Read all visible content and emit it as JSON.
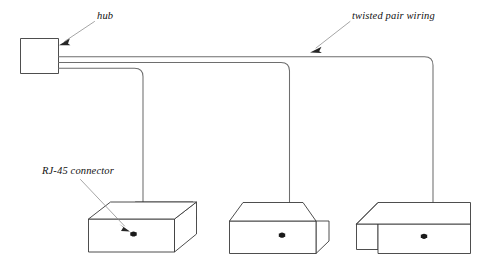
{
  "diagram": {
    "background_color": "#ffffff",
    "line_color": "#3a3a3a",
    "cable_color": "#6e6e6e",
    "leader_color": "#888888",
    "labels": {
      "hub": "hub",
      "twisted_pair": "twisted pair wiring",
      "rj45": "RJ-45 connector"
    },
    "nodes": {
      "hub": {
        "name": "hub",
        "shape": "rectangle",
        "ports": 3
      },
      "workstations": [
        {
          "name": "workstation-1",
          "shape": "isometric-box"
        },
        {
          "name": "workstation-2",
          "shape": "isometric-box"
        },
        {
          "name": "workstation-3",
          "shape": "isometric-box"
        }
      ]
    },
    "cables": [
      {
        "name": "cable-1",
        "from": "hub",
        "to": "workstation-1",
        "type": "twisted pair"
      },
      {
        "name": "cable-2",
        "from": "hub",
        "to": "workstation-2",
        "type": "twisted pair"
      },
      {
        "name": "cable-3",
        "from": "hub",
        "to": "workstation-3",
        "type": "twisted pair"
      }
    ],
    "connectors": [
      {
        "name": "rj45-connector-1",
        "at": "workstation-1"
      },
      {
        "name": "rj45-connector-2",
        "at": "workstation-2"
      },
      {
        "name": "rj45-connector-3",
        "at": "workstation-3"
      }
    ]
  }
}
